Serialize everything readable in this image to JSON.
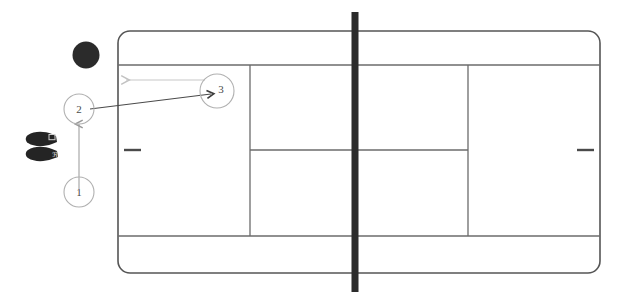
{
  "diagram": {
    "court": {
      "name": "tennis-court",
      "outer_line_color": "#555555",
      "inner_line_color": "#6b6b6b",
      "surface_color": "#ffffff",
      "corner_radius": 12,
      "bounds": {
        "x": 118,
        "y": 31,
        "width": 482,
        "height": 242
      },
      "lines": {
        "doubles_sideline_top_label": "doubles sideline (top)",
        "doubles_sideline_bottom_label": "doubles sideline (bottom)",
        "singles_sideline_top_y": 65,
        "singles_sideline_bottom_y": 236,
        "service_line_left_x": 250,
        "service_line_right_x": 468,
        "center_service_line_y": 150,
        "center_marks": [
          {
            "name": "center-mark-left",
            "x1": 124,
            "x2": 140,
            "y": 150
          },
          {
            "name": "center-mark-right",
            "x1": 578,
            "x2": 594,
            "y": 150
          }
        ]
      },
      "net": {
        "name": "tennis-net",
        "x": 355,
        "y_top": 12,
        "y_bottom": 292,
        "thickness": 7,
        "color": "#2b2b2b"
      }
    },
    "ball": {
      "name": "ball",
      "cx": 86,
      "cy": 55,
      "r": 13,
      "color": "#2b2b2b"
    },
    "shoes": [
      {
        "name": "shoe-upper",
        "cx": 42,
        "cy": 140,
        "color": "#222222"
      },
      {
        "name": "shoe-lower",
        "cx": 42,
        "cy": 155,
        "color": "#222222"
      }
    ],
    "markers": [
      {
        "id": "marker-1",
        "label": "1",
        "cx": 79,
        "cy": 192,
        "r": 15
      },
      {
        "id": "marker-2",
        "label": "2",
        "cx": 79,
        "cy": 109,
        "r": 15
      },
      {
        "id": "marker-3",
        "label": "3",
        "cx": 217,
        "cy": 91,
        "r": 17
      }
    ],
    "arrows": [
      {
        "name": "arrow-1-to-2",
        "from": "marker-1",
        "to": "marker-2",
        "x1": 79,
        "y1": 188,
        "x2": 79,
        "y2": 121,
        "color": "#9a9a9a",
        "style": "solid",
        "head": "up"
      },
      {
        "name": "arrow-2-to-3",
        "from": "marker-2",
        "to": "marker-3",
        "x1": 89,
        "y1": 108,
        "x2": 213,
        "y2": 93,
        "color": "#4a4a4a",
        "style": "solid",
        "head": "right"
      },
      {
        "name": "arrow-3-recovery-left",
        "from": "marker-3",
        "to": "court-left",
        "x1": 204,
        "y1": 80,
        "x2": 122,
        "y2": 80,
        "color": "#c2c2c2",
        "style": "solid",
        "head": "left"
      }
    ]
  }
}
